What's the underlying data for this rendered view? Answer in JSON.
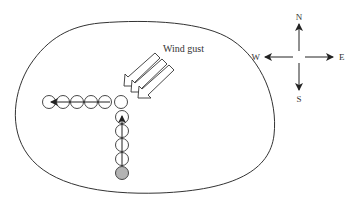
{
  "diagram": {
    "wind_label": "Wind gust",
    "compass": {
      "north": "N",
      "south": "S",
      "east": "E",
      "west": "W"
    },
    "colors": {
      "stroke": "#333333",
      "start_fill": "#b3b3b3",
      "background": "#ffffff"
    },
    "path": {
      "vertical_circles": 6,
      "horizontal_circles": 6,
      "start_marker": "gray filled circle",
      "direction_first": "north",
      "direction_second": "west"
    }
  }
}
